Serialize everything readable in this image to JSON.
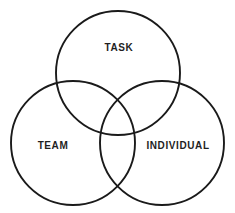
{
  "diagram": {
    "type": "venn-3-circle",
    "background_color": "#ffffff",
    "stroke_color": "#1a1a1a",
    "stroke_width": 1.9,
    "label_color": "#1f1f1f",
    "canvas": {
      "width": 235,
      "height": 213
    },
    "circles": [
      {
        "id": "task",
        "label": "TASK",
        "cx": 118,
        "cy": 73,
        "r": 62,
        "label_x": 119,
        "label_y": 48
      },
      {
        "id": "team",
        "label": "TEAM",
        "cx": 73,
        "cy": 143,
        "r": 62,
        "label_x": 53,
        "label_y": 146
      },
      {
        "id": "individual",
        "label": "INDIVIDUAL",
        "cx": 162,
        "cy": 143,
        "r": 62,
        "label_x": 178,
        "label_y": 146
      }
    ]
  }
}
